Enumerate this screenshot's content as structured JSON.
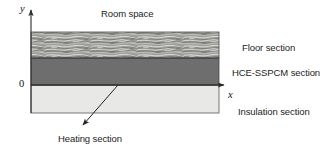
{
  "figure": {
    "type": "cross-section-schematic",
    "title_visible": false
  },
  "axes": {
    "y_label": "y",
    "x_label": "x",
    "origin_label": "0",
    "y_axis": {
      "x": 31,
      "top": 7,
      "bottom": 113,
      "arrow": "up"
    },
    "x_axis": {
      "y": 85,
      "left": 31,
      "right": 228,
      "arrow": "right"
    }
  },
  "layers": [
    {
      "name": "floor",
      "label": "Floor section",
      "fill": "#9a9a97",
      "texture": "wood-grain-streaks",
      "top": 32,
      "bottom": 58
    },
    {
      "name": "hce_sspcm",
      "label": "HCE-SSPCM section",
      "fill": "#6e6e6e",
      "texture": "solid",
      "top": 58,
      "bottom": 85
    },
    {
      "name": "insulation",
      "label": "Insulation section",
      "fill": "#e8e8e6",
      "texture": "solid",
      "top": 85,
      "bottom": 113
    }
  ],
  "labels": {
    "room_space": "Room space",
    "floor_section": "Floor section",
    "hce_sspcm_section": "HCE-SSPCM section",
    "insulation_section": "Insulation section",
    "heating_section": "Heating section"
  },
  "annotations": [
    {
      "name": "heating-section-leader",
      "text": "Heating section",
      "from_x": 118,
      "from_y": 85,
      "to_x": 80,
      "to_y": 128,
      "arrowhead_at": "to"
    }
  ],
  "geometry": {
    "block_left": 31,
    "block_right": 219,
    "block_top": 32,
    "block_bottom": 113
  },
  "colors": {
    "stroke": "#3a3a3a",
    "text": "#1d1d1d",
    "floor_fill": "#9a9a97",
    "hce_fill": "#6e6e6e",
    "insulation_fill": "#e8e8e6",
    "background": "#ffffff"
  }
}
